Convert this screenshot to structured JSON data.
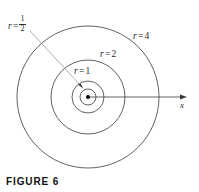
{
  "figure": {
    "caption": "FIGURE 6",
    "background_color": "#ffffff",
    "stroke_color": "#3a3a3a",
    "text_color": "#2b2b2b"
  },
  "labels": {
    "r_half": {
      "variable": "r",
      "equals": "=",
      "numerator": "1",
      "denominator": "2"
    },
    "r_one": {
      "variable": "r",
      "equals": "=",
      "value": "1"
    },
    "r_two": {
      "variable": "r",
      "equals": "=",
      "value": "2"
    },
    "r_four": {
      "variable": "r",
      "equals": "=",
      "value": "4"
    },
    "x_axis": "x"
  },
  "chart_data": {
    "type": "scatter",
    "title": "FIGURE 6",
    "subtitle": "",
    "xlabel": "x",
    "ylabel": "",
    "grid": false,
    "legend_position": "none",
    "coordinate_system": "polar",
    "origin": {
      "x": 88,
      "y": 97,
      "marked": true,
      "marker": "filled-dot"
    },
    "pixels_per_unit": 17.8,
    "circles": [
      {
        "label": "r = 1/2",
        "r": 0.5,
        "radius_px": 8,
        "cx": 88,
        "cy": 97
      },
      {
        "label": "r = 1",
        "r": 1,
        "radius_px": 16,
        "cx": 88,
        "cy": 97
      },
      {
        "label": "r = 2",
        "r": 2,
        "radius_px": 37,
        "cx": 88,
        "cy": 97
      },
      {
        "label": "r = 4",
        "r": 4,
        "radius_px": 71,
        "cx": 88,
        "cy": 97
      }
    ],
    "axes": [
      {
        "name": "x",
        "type": "ray",
        "from": [
          88,
          97
        ],
        "to": [
          186,
          97
        ],
        "arrowhead": true,
        "label": "x"
      }
    ],
    "annotations": [
      {
        "text": "r = 1/2",
        "leader_from": [
          30,
          31
        ],
        "leader_to": [
          82,
          87
        ],
        "arrowhead": true,
        "target": "r = 1/2 circle"
      },
      {
        "text": "r = 1",
        "at": [
          74,
          67
        ]
      },
      {
        "text": "r = 2",
        "at": [
          100,
          50
        ]
      },
      {
        "text": "r = 4",
        "at": [
          133,
          32
        ]
      }
    ],
    "xlim": [
      -4.5,
      5.5
    ],
    "ylim": [
      -4.5,
      4.5
    ]
  }
}
